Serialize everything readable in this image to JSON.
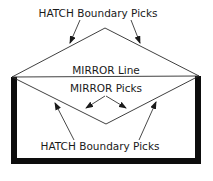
{
  "diagram": {
    "labels": {
      "top_label": "HATCH Boundary Picks",
      "mirror_line_label": "MIRROR Line",
      "mirror_picks_label": "MIRROR Picks",
      "bottom_label": "HATCH Boundary Picks"
    },
    "colors": {
      "line": "#2a2a2a",
      "wall": "#0d0d0d",
      "background": "#ffffff",
      "text": "#1a1a1a"
    }
  }
}
